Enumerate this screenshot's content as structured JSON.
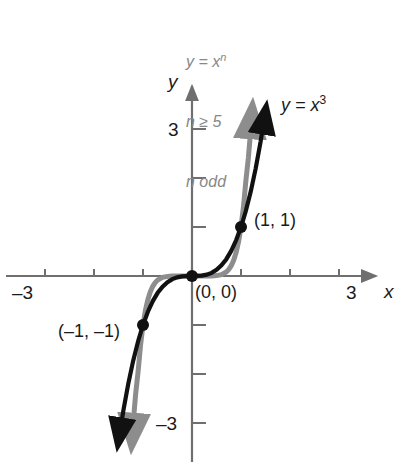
{
  "chart_data": {
    "type": "line",
    "title": "",
    "subtitle": "",
    "xlabel": "x",
    "ylabel": "y",
    "xlim": [
      -3.9,
      4.1
    ],
    "ylim": [
      -3.6,
      3.6
    ],
    "grid": false,
    "legend_position": "none",
    "x_ticks": [
      -3,
      3
    ],
    "y_ticks": [
      3,
      -3
    ],
    "x_tick_labels": [
      "–3",
      "3"
    ],
    "y_tick_labels": [
      "3",
      "–3"
    ],
    "minor_x_ticks": [
      -3,
      -2,
      -1,
      1,
      2,
      3
    ],
    "minor_y_ticks": [
      -3,
      -2,
      -1,
      1,
      2,
      3
    ],
    "series": [
      {
        "name": "y = x³",
        "equation": "y = x^3",
        "color": "#111111",
        "exponent": 3,
        "points": [
          [
            -1.49,
            -3.31
          ],
          [
            -1.4,
            -2.744
          ],
          [
            -1.3,
            -2.197
          ],
          [
            -1.2,
            -1.728
          ],
          [
            -1.1,
            -1.331
          ],
          [
            -1.0,
            -1.0
          ],
          [
            -0.9,
            -0.729
          ],
          [
            -0.8,
            -0.512
          ],
          [
            -0.7,
            -0.343
          ],
          [
            -0.6,
            -0.216
          ],
          [
            -0.5,
            -0.125
          ],
          [
            -0.4,
            -0.064
          ],
          [
            -0.3,
            -0.027
          ],
          [
            -0.2,
            -0.008
          ],
          [
            -0.1,
            -0.001
          ],
          [
            0.0,
            0.0
          ],
          [
            0.1,
            0.001
          ],
          [
            0.2,
            0.008
          ],
          [
            0.3,
            0.027
          ],
          [
            0.4,
            0.064
          ],
          [
            0.5,
            0.125
          ],
          [
            0.6,
            0.216
          ],
          [
            0.7,
            0.343
          ],
          [
            0.8,
            0.512
          ],
          [
            0.9,
            0.729
          ],
          [
            1.0,
            1.0
          ],
          [
            1.1,
            1.331
          ],
          [
            1.2,
            1.728
          ],
          [
            1.3,
            2.197
          ],
          [
            1.4,
            2.744
          ],
          [
            1.49,
            3.31
          ]
        ]
      },
      {
        "name": "y = xⁿ",
        "equation": "y = x^n",
        "color": "#8d8d8d",
        "exponent": 7,
        "points": [
          [
            -1.22,
            -3.3
          ],
          [
            -1.18,
            -2.76
          ],
          [
            -1.15,
            -2.41
          ],
          [
            -1.1,
            -1.95
          ],
          [
            -1.05,
            -1.41
          ],
          [
            -1.0,
            -1.0
          ],
          [
            -0.95,
            -0.7
          ],
          [
            -0.9,
            -0.48
          ],
          [
            -0.85,
            -0.32
          ],
          [
            -0.8,
            -0.21
          ],
          [
            -0.75,
            -0.133
          ],
          [
            -0.7,
            -0.082
          ],
          [
            -0.6,
            -0.028
          ],
          [
            -0.5,
            -0.0078
          ],
          [
            -0.4,
            -0.0016
          ],
          [
            -0.3,
            -0.0002
          ],
          [
            -0.2,
            0.0
          ],
          [
            -0.1,
            0.0
          ],
          [
            0.0,
            0.0
          ],
          [
            0.1,
            0.0
          ],
          [
            0.2,
            0.0
          ],
          [
            0.3,
            0.0002
          ],
          [
            0.4,
            0.0016
          ],
          [
            0.5,
            0.0078
          ],
          [
            0.6,
            0.028
          ],
          [
            0.7,
            0.082
          ],
          [
            0.75,
            0.133
          ],
          [
            0.8,
            0.21
          ],
          [
            0.85,
            0.32
          ],
          [
            0.9,
            0.48
          ],
          [
            0.95,
            0.7
          ],
          [
            1.0,
            1.0
          ],
          [
            1.05,
            1.41
          ],
          [
            1.1,
            1.95
          ],
          [
            1.15,
            2.41
          ],
          [
            1.18,
            2.76
          ],
          [
            1.22,
            3.3
          ]
        ]
      }
    ],
    "marked_points": [
      {
        "label": "(1, 1)",
        "x": 1,
        "y": 1
      },
      {
        "label": "(0, 0)",
        "x": 0,
        "y": 0
      },
      {
        "label": "(–1, –1)",
        "x": -1,
        "y": -1
      }
    ],
    "annotations": [
      {
        "name": "family-equation",
        "text": "y = x",
        "superscript": "n"
      },
      {
        "name": "family-condition-range",
        "text": "n ≥ 5"
      },
      {
        "name": "family-condition-parity",
        "text": "n odd"
      },
      {
        "name": "cubic-curve-label",
        "text": "y = x",
        "superscript": "3"
      }
    ]
  },
  "labels": {
    "y_axis": "y",
    "x_axis": "x",
    "y_tick_top": "3",
    "y_tick_bottom": "–3",
    "x_tick_left": "–3",
    "x_tick_right": "3",
    "point_one_one": "(1, 1)",
    "point_origin": "(0, 0)",
    "point_neg_one": "(–1, –1)",
    "curve_cubic": "y = x",
    "curve_cubic_exp": "3",
    "family_eq": "y = x",
    "family_eq_exp": "n",
    "family_range": "n ≥ 5",
    "family_parity": "n odd"
  },
  "colors": {
    "cubic_curve": "#111111",
    "family_curve": "#8d8d8d",
    "axis": "#6f6f6f",
    "text": "#1a1a1a",
    "annotation_text": "#888888",
    "background": "#ffffff"
  }
}
